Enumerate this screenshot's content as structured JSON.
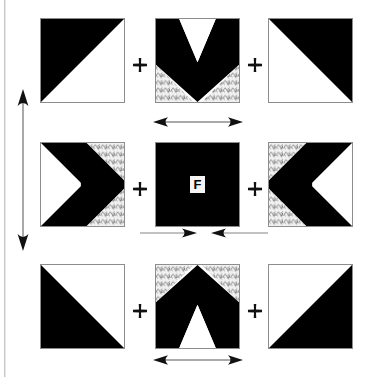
{
  "diagram": {
    "center_label": "F",
    "colors": {
      "fabric_dark": "#000000",
      "fabric_light": "#ffffff",
      "fabric_print": "#efefef",
      "patch_border": "#8d8d8d",
      "page_rule": "#c9c9c9",
      "label_background": "#f4f4f4",
      "label_text": "#000000"
    },
    "grid": {
      "rows": 3,
      "columns": 3,
      "patch_size_px": 85
    },
    "patches": [
      {
        "id": "patch-top-left",
        "position": "top-left",
        "shape": "half-square-triangle",
        "dark_region": "upper-left",
        "fabrics": [
          "dark",
          "light"
        ]
      },
      {
        "id": "patch-top-center",
        "position": "top-center",
        "shape": "chevron",
        "chevron_direction": "down",
        "fabrics": [
          "light",
          "dark",
          "print"
        ]
      },
      {
        "id": "patch-top-right",
        "position": "top-right",
        "shape": "half-square-triangle",
        "dark_region": "upper-right",
        "fabrics": [
          "dark",
          "light"
        ]
      },
      {
        "id": "patch-middle-left",
        "position": "middle-left",
        "shape": "chevron",
        "chevron_direction": "right",
        "fabrics": [
          "light",
          "dark",
          "print"
        ]
      },
      {
        "id": "patch-center",
        "position": "center",
        "shape": "solid-square",
        "dark_region": "all",
        "fabrics": [
          "dark"
        ]
      },
      {
        "id": "patch-middle-right",
        "position": "middle-right",
        "shape": "chevron",
        "chevron_direction": "left",
        "fabrics": [
          "print",
          "dark",
          "light"
        ]
      },
      {
        "id": "patch-bottom-left",
        "position": "bottom-left",
        "shape": "half-square-triangle",
        "dark_region": "lower-left",
        "fabrics": [
          "dark",
          "light"
        ]
      },
      {
        "id": "patch-bottom-center",
        "position": "bottom-center",
        "shape": "chevron",
        "chevron_direction": "up",
        "fabrics": [
          "print",
          "dark",
          "light"
        ]
      },
      {
        "id": "patch-bottom-right",
        "position": "bottom-right",
        "shape": "half-square-triangle",
        "dark_region": "lower-right",
        "fabrics": [
          "dark",
          "light"
        ]
      }
    ],
    "plus_signs": [
      {
        "id": "plus-top-left",
        "between": "top-left and top-center"
      },
      {
        "id": "plus-top-right",
        "between": "top-center and top-right"
      },
      {
        "id": "plus-middle-left",
        "between": "middle-left and center"
      },
      {
        "id": "plus-middle-right",
        "between": "center and middle-right"
      },
      {
        "id": "plus-bottom-left",
        "between": "bottom-left and bottom-center"
      },
      {
        "id": "plus-bottom-right",
        "between": "bottom-center and bottom-right"
      }
    ],
    "arrows": [
      {
        "id": "arrow-vertical-height",
        "orientation": "vertical",
        "style": "double-headed",
        "location": "left side of block",
        "meaning": "overall block height"
      },
      {
        "id": "arrow-top-width",
        "orientation": "horizontal",
        "style": "double-headed",
        "location": "below top-center patch",
        "meaning": "patch width"
      },
      {
        "id": "arrow-center-inward",
        "orientation": "horizontal",
        "style": "inward-pointing-pair",
        "location": "below center patch",
        "meaning": "center patch width"
      },
      {
        "id": "arrow-bottom-width",
        "orientation": "horizontal",
        "style": "double-headed",
        "location": "below bottom-center patch",
        "meaning": "patch width"
      }
    ]
  }
}
